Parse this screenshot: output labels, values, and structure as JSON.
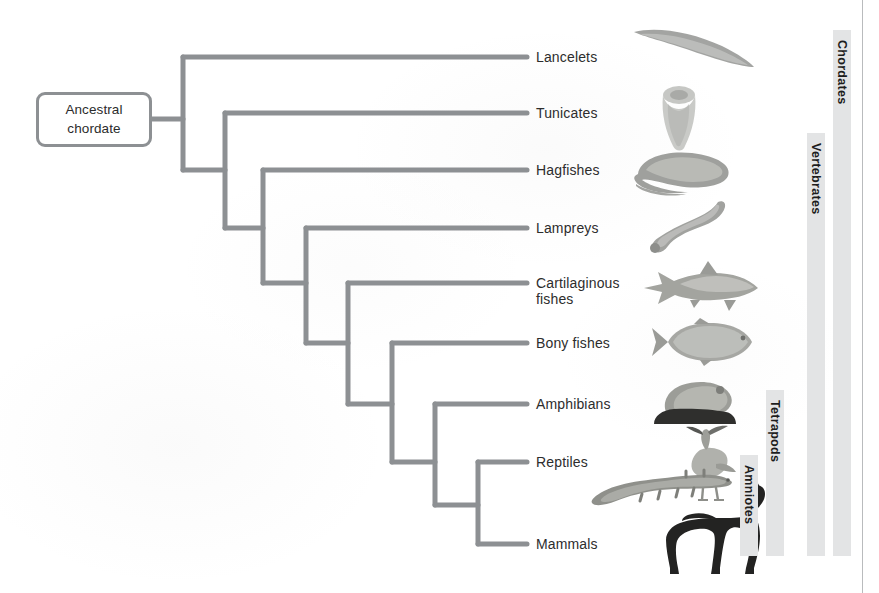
{
  "figure": {
    "type": "cladogram",
    "root_label_line1": "Ancestral",
    "root_label_line2": "chordate"
  },
  "taxa": [
    {
      "id": "lancelets",
      "label": "Lancelets",
      "tip_y": 57,
      "icon": "lancelet-silhouette"
    },
    {
      "id": "tunicates",
      "label": "Tunicates",
      "tip_y": 113,
      "icon": "tunicate-silhouette"
    },
    {
      "id": "hagfishes",
      "label": "Hagfishes",
      "tip_y": 170,
      "icon": "hagfish-silhouette"
    },
    {
      "id": "lampreys",
      "label": "Lampreys",
      "tip_y": 228,
      "icon": "lamprey-silhouette"
    },
    {
      "id": "cartilaginous-fishes",
      "label": "Cartilaginous\nfishes",
      "tip_y": 283,
      "icon": "shark-silhouette"
    },
    {
      "id": "bony-fishes",
      "label": "Bony fishes",
      "tip_y": 343,
      "icon": "bony-fish-silhouette"
    },
    {
      "id": "amphibians",
      "label": "Amphibians",
      "tip_y": 404,
      "icon": "frog-silhouette"
    },
    {
      "id": "reptiles",
      "label": "Reptiles",
      "tip_y": 462,
      "icon": "bird-silhouette"
    },
    {
      "id": "mammals",
      "label": "Mammals",
      "tip_y": 544,
      "icon": "horse-silhouette"
    }
  ],
  "clades": [
    {
      "id": "chordates",
      "label": "Chordates",
      "x": 833,
      "top": 30,
      "bottom": 556
    },
    {
      "id": "vertebrates",
      "label": "Vertebrates",
      "x": 807,
      "top": 133,
      "bottom": 556
    },
    {
      "id": "tetrapods",
      "label": "Tetrapods",
      "x": 766,
      "top": 390,
      "bottom": 556
    },
    {
      "id": "amniotes",
      "label": "Amniotes",
      "x": 740,
      "top": 455,
      "bottom": 556
    }
  ],
  "colors": {
    "branch": "#8d9093",
    "clade_bar": "#e3e4e5",
    "text": "#2d2d2d",
    "rule": "#b9bbbd",
    "background": "#ffffff"
  },
  "tree_geometry": {
    "note": "ladder-style cladogram; each internal node branches to one tip and one deeper node",
    "root_stem_x": [
      152,
      183
    ],
    "root_stem_y": 119,
    "node_x": [
      183,
      225,
      263,
      306,
      348,
      392,
      435,
      478
    ],
    "tip_end_x": 527
  }
}
